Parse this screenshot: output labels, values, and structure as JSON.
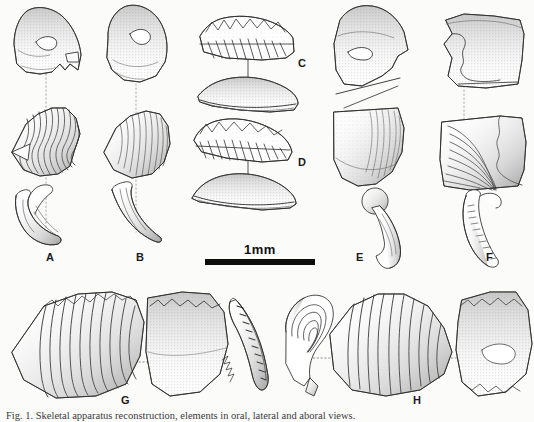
{
  "figure": {
    "background_color": "#fbfbfa",
    "ink_color": "#2b2b2b",
    "shade_color": "#9a9a9a",
    "scale_bar": {
      "label": "1mm",
      "length_px": 110
    },
    "caption_text": "Fig. 1. Skeletal apparatus reconstruction, elements in oral, lateral and aboral views."
  },
  "panels": [
    {
      "id": "A",
      "label": "A",
      "x": 46,
      "y": 252,
      "elements": [
        "platform-element-oral-view",
        "ribbed-element-lateral-view",
        "hook-element-lateral-view"
      ]
    },
    {
      "id": "B",
      "label": "B",
      "x": 136,
      "y": 252,
      "elements": [
        "platform-element-oral-view",
        "ribbed-element-lateral-view",
        "hook-element-lateral-view"
      ]
    },
    {
      "id": "C",
      "label": "C",
      "x": 298,
      "y": 58,
      "elements": [
        "blade-element-oral-view",
        "blade-element-lateral-view"
      ]
    },
    {
      "id": "D",
      "label": "D",
      "x": 298,
      "y": 157,
      "elements": [
        "blade-element-oral-view",
        "blade-element-lateral-view"
      ]
    },
    {
      "id": "E",
      "label": "E",
      "x": 356,
      "y": 252,
      "elements": [
        "platform-element-oral-view",
        "ribbed-element-lateral-view",
        "hook-element-lateral-view"
      ]
    },
    {
      "id": "F",
      "label": "F",
      "x": 486,
      "y": 252,
      "elements": [
        "platform-element-oral-view",
        "ribbed-element-lateral-view",
        "denticulate-hook-element"
      ]
    },
    {
      "id": "G",
      "label": "G",
      "x": 121,
      "y": 395,
      "elements": [
        "large-ribbed-element",
        "large-platform-element",
        "denticulate-blade-element"
      ]
    },
    {
      "id": "H",
      "label": "H",
      "x": 413,
      "y": 395,
      "elements": [
        "coiled-element",
        "large-ribbed-element",
        "large-platform-element"
      ]
    }
  ]
}
